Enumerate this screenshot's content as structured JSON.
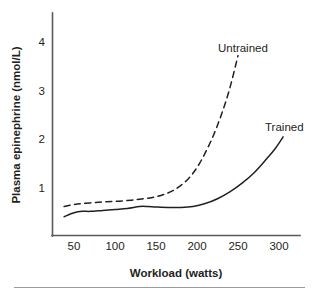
{
  "chart_data": {
    "type": "line",
    "title": "",
    "xlabel": "Workload (watts)",
    "ylabel": "Plasma epinephrine (nmol/L)",
    "xlim": [
      33,
      313
    ],
    "ylim": [
      0,
      4.45
    ],
    "xticks": [
      50,
      100,
      150,
      200,
      250,
      300
    ],
    "xtick_labels": [
      "50",
      "100",
      "150",
      "200",
      "250",
      "300"
    ],
    "yticks": [
      1,
      2,
      3,
      4
    ],
    "ytick_labels": [
      "1",
      "2",
      "3",
      "4"
    ],
    "grid": false,
    "legend_position": "inline-annotation",
    "series": [
      {
        "name": "Untrained",
        "style": "dashed",
        "color": "#231f20",
        "label_text": "Untrained",
        "x": [
          38,
          50,
          60,
          75,
          90,
          105,
          120,
          130,
          140,
          150,
          160,
          170,
          180,
          190,
          200,
          210,
          220,
          230,
          240,
          250
        ],
        "y": [
          0.62,
          0.66,
          0.68,
          0.7,
          0.72,
          0.73,
          0.75,
          0.77,
          0.79,
          0.82,
          0.87,
          0.94,
          1.05,
          1.2,
          1.42,
          1.72,
          2.08,
          2.52,
          3.05,
          3.72
        ]
      },
      {
        "name": "Trained",
        "style": "solid",
        "color": "#231f20",
        "label_text": "Trained",
        "x": [
          38,
          50,
          60,
          70,
          85,
          100,
          115,
          130,
          140,
          150,
          165,
          180,
          195,
          210,
          225,
          240,
          255,
          270,
          285,
          295,
          305
        ],
        "y": [
          0.41,
          0.49,
          0.52,
          0.52,
          0.54,
          0.56,
          0.58,
          0.62,
          0.62,
          0.61,
          0.6,
          0.6,
          0.62,
          0.68,
          0.78,
          0.92,
          1.1,
          1.32,
          1.6,
          1.8,
          2.05
        ]
      }
    ],
    "annotations": [
      {
        "text": "Untrained",
        "x_px": 218,
        "y_px": 48
      },
      {
        "text": "Trained",
        "x_px": 265,
        "y_px": 127
      }
    ]
  },
  "figure": {
    "x_axis_title": "Workload (watts)",
    "y_axis_title": "Plasma epinephrine (nmol/L)",
    "series_label_untrained": "Untrained",
    "series_label_trained": "Trained",
    "ytick_4": "4",
    "ytick_3": "3",
    "ytick_2": "2",
    "ytick_1": "1",
    "xtick_50": "50",
    "xtick_100": "100",
    "xtick_150": "150",
    "xtick_200": "200",
    "xtick_250": "250",
    "xtick_300": "300"
  }
}
